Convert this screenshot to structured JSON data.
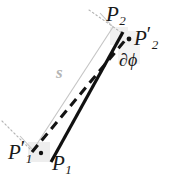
{
  "figure": {
    "type": "geometry-diagram",
    "background_color": "#ffffff",
    "width": 182,
    "height": 189,
    "colors": {
      "line": "#111111",
      "guide": "#c0c0c0",
      "dotted": "#b0b0b0",
      "label": "#1a1a1a",
      "s_label": "#b4b4b4"
    },
    "labels": {
      "p2": {
        "base": "P",
        "sub": "2",
        "prime": ""
      },
      "p2_prime": {
        "base": "P",
        "sub": "2",
        "prime": "′"
      },
      "p1": {
        "base": "P",
        "sub": "1",
        "prime": ""
      },
      "p1_prime": {
        "base": "P",
        "sub": "1",
        "prime": "′"
      },
      "dphi": "∂ϕ",
      "s": "s"
    },
    "elements": {
      "solid_segment_name": "segment-P1-P2",
      "dashed_segment_name": "segment-P1prime-P2prime",
      "guide_segment_name": "arclength-s-guide",
      "dot_p2_name": "point-P2prime-dot",
      "dot_p1_name": "point-P1prime-dot"
    },
    "geometry": {
      "solid_line": {
        "x1": 52,
        "y1": 161,
        "x2": 123,
        "y2": 32
      },
      "dashed_line": {
        "x1": 31,
        "y1": 152,
        "x2": 127,
        "y2": 38
      },
      "guide_line": {
        "x1": 33,
        "y1": 150,
        "x2": 113,
        "y2": 27
      },
      "dotted_top": {
        "x1": 89,
        "y1": 10,
        "x2": 122,
        "y2": 33
      },
      "dotted_bottom": {
        "x1": 3,
        "y1": 122,
        "x2": 32,
        "y2": 151
      },
      "guide_cap_top": {
        "x1": 100,
        "y1": 14,
        "x2": 113,
        "y2": 27
      },
      "guide_cap_bottom": {
        "x1": 20,
        "y1": 137,
        "x2": 33,
        "y2": 150
      },
      "dot_p2prime": {
        "cx": 128,
        "cy": 39,
        "r": 2.3
      },
      "dot_p1prime": {
        "cx": 40,
        "cy": 153,
        "r": 2.3
      }
    }
  }
}
